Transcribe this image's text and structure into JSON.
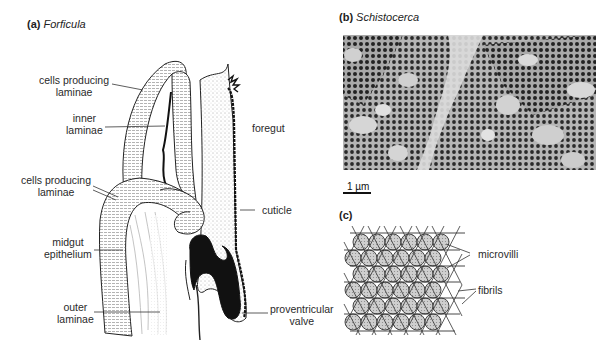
{
  "figure": {
    "panel_a": {
      "letter": "(a)",
      "taxon": "Forficula",
      "labels": {
        "cells_producing_laminae_top": [
          "cells producing",
          "laminae"
        ],
        "inner_laminae": [
          "inner",
          "laminae"
        ],
        "foregut": "foregut",
        "cells_producing_laminae_mid": [
          "cells producing",
          "laminae"
        ],
        "cuticle": "cuticle",
        "midgut_epithelium": [
          "midgut",
          "epithelium"
        ],
        "outer_laminae": [
          "outer",
          "laminae"
        ],
        "proventricular_valve": [
          "proventricular",
          "valve"
        ]
      }
    },
    "panel_b": {
      "letter": "(b)",
      "taxon": "Schistocerca",
      "scale_bar": "1 µm"
    },
    "panel_c": {
      "letter": "(c)",
      "labels": {
        "microvilli": "microvilli",
        "fibrils": "fibrils"
      }
    }
  }
}
